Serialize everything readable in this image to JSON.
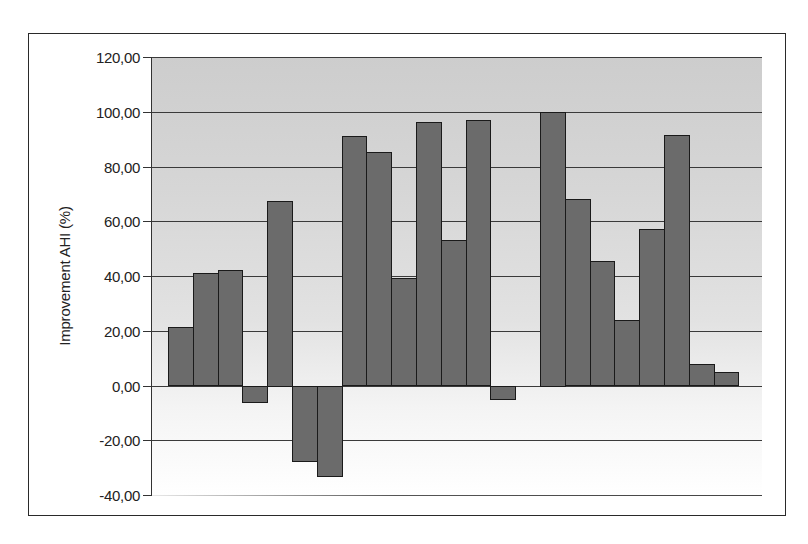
{
  "chart_data": {
    "type": "bar",
    "title": "",
    "xlabel": "",
    "ylabel": "Improvement AHI (%)",
    "ylim": [
      -40,
      120
    ],
    "yticks": [
      -40,
      -20,
      0,
      20,
      40,
      60,
      80,
      100,
      120
    ],
    "ytick_labels": [
      "-40,00",
      "-20,00",
      "0,00",
      "20,00",
      "40,00",
      "60,00",
      "80,00",
      "100,00",
      "120,00"
    ],
    "grid": true,
    "legend": null,
    "categories": [
      "1",
      "2",
      "3",
      "4",
      "5",
      "6",
      "7",
      "8",
      "9",
      "10",
      "11",
      "12",
      "13",
      "14",
      "15",
      "16",
      "17",
      "18",
      "19",
      "20",
      "21",
      "22",
      "23"
    ],
    "values": [
      21.2,
      41.0,
      42.3,
      -6.2,
      67.5,
      -27.7,
      -33.2,
      91.0,
      85.4,
      39.4,
      96.4,
      53.0,
      97.1,
      -5.0,
      0.0,
      100.0,
      68.0,
      45.6,
      24.0,
      57.3,
      91.6,
      7.7,
      5.1
    ],
    "bar_color": "#6b6b6b",
    "bar_edge_color": "#1a1a1a"
  },
  "axis": {
    "y_title": "Improvement AHI (%)"
  }
}
